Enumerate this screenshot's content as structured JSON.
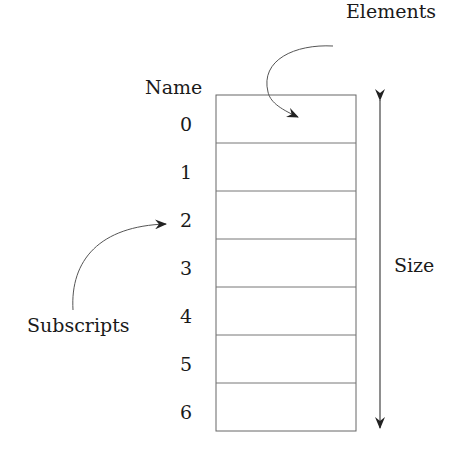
{
  "diagram": {
    "title_labels": {
      "name": "Name",
      "elements": "Elements",
      "size": "Size",
      "subscripts": "Subscripts"
    },
    "subscripts": [
      "0",
      "1",
      "2",
      "3",
      "4",
      "5",
      "6"
    ],
    "cell_count": 7,
    "colors": {
      "stroke": "#555555",
      "text": "#1a1a1a",
      "arrow": "#222222"
    }
  }
}
